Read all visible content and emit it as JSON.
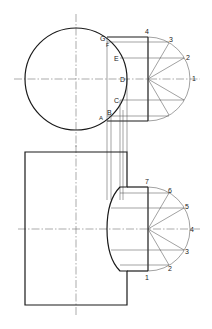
{
  "diagram": {
    "type": "orthographic-intersection-drawing",
    "top_view": {
      "circle_labels": [
        "G",
        "F",
        "E",
        "D",
        "C",
        "B",
        "A"
      ],
      "semicircle_labels": [
        "4",
        "3",
        "2",
        "1"
      ]
    },
    "front_view": {
      "semicircle_labels": [
        "7",
        "6",
        "5",
        "4",
        "3",
        "2",
        "1"
      ]
    }
  },
  "labels": {
    "G": "G",
    "F": "F",
    "E": "E",
    "D": "D",
    "C": "C",
    "B": "B",
    "A": "A",
    "t4": "4",
    "t3": "3",
    "t2": "2",
    "t1": "1",
    "b7": "7",
    "b6": "6",
    "b5": "5",
    "b4": "4",
    "b3": "3",
    "b2": "2",
    "b1": "1"
  }
}
